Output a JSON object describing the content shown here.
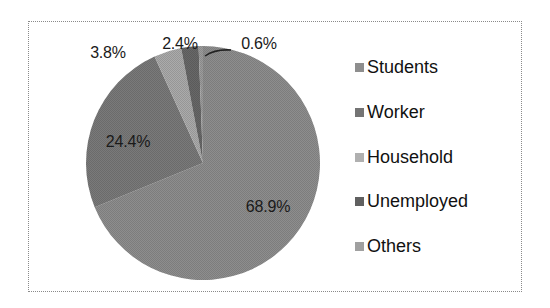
{
  "chart_data": {
    "type": "pie",
    "title": "",
    "categories": [
      "Students",
      "Worker",
      "Household",
      "Unemployed",
      "Others"
    ],
    "values": [
      68.9,
      24.4,
      3.8,
      2.4,
      0.6
    ],
    "value_labels": [
      "68.9%",
      "24.4%",
      "3.8%",
      "2.4%",
      "0.6%"
    ],
    "colors": [
      "#8e8e8e",
      "#7a7a7a",
      "#ababab",
      "#686868",
      "#9c9c9c"
    ],
    "start_angle": "12 o'clock",
    "direction": "clockwise",
    "legend_position": "right"
  },
  "legend": {
    "items": [
      {
        "label": "Students",
        "color": "#8e8e8e"
      },
      {
        "label": "Worker",
        "color": "#747474"
      },
      {
        "label": "Household",
        "color": "#b0b0b0"
      },
      {
        "label": "Unemployed",
        "color": "#606060"
      },
      {
        "label": "Others",
        "color": "#a0a0a0"
      }
    ]
  },
  "labels": {
    "students": "68.9%",
    "worker": "24.4%",
    "household": "3.8%",
    "unemployed": "2.4%",
    "others": "0.6%"
  }
}
